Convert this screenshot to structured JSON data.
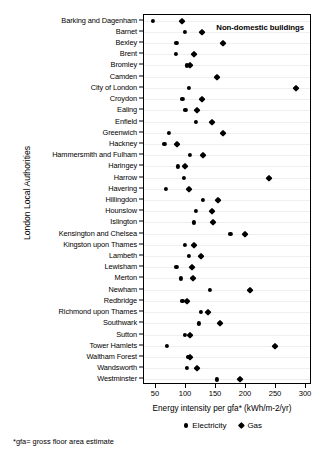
{
  "chart_data": {
    "type": "scatter",
    "title": "Non-domestic buildings",
    "xlabel": "Energy intensity per gfa* (kWh/m-2/yr)",
    "ylabel": "London Local Authorities",
    "xlim": [
      30,
      310
    ],
    "xticks": [
      50,
      100,
      150,
      200,
      250,
      300
    ],
    "xticklabels": [
      "50",
      "100",
      "150",
      "200",
      "250",
      "300"
    ],
    "grid": true,
    "legend_position": "bottom",
    "footnote": "*gfa= gross floor area estimate",
    "series": [
      {
        "name": "Electricity",
        "marker": "circle"
      },
      {
        "name": "Gas",
        "marker": "diamond"
      }
    ],
    "categories": [
      "Barking and Dagenham",
      "Barnet",
      "Bexley",
      "Brent",
      "Bromley",
      "Camden",
      "City of London",
      "Croydon",
      "Ealing",
      "Enfield",
      "Greenwich",
      "Hackney",
      "Hammersmith and Fulham",
      "Haringey",
      "Harrow",
      "Havering",
      "Hillingdon",
      "Hounslow",
      "Islington",
      "Kensington and Chelsea",
      "Kingston upon Thames",
      "Lambeth",
      "Lewisham",
      "Merton",
      "Newham",
      "Redbridge",
      "Richmond upon Thames",
      "Southwark",
      "Sutton",
      "Tower Hamlets",
      "Waltham Forest",
      "Wandsworth",
      "Westminster"
    ],
    "electricity": [
      45,
      98,
      84,
      83,
      101,
      151,
      105,
      94,
      99,
      117,
      71,
      64,
      107,
      87,
      96,
      67,
      128,
      117,
      113,
      174,
      98,
      105,
      84,
      92,
      140,
      94,
      125,
      121,
      98,
      68,
      103,
      102,
      152
    ],
    "gas": [
      94,
      127,
      161,
      113,
      106,
      151,
      283,
      127,
      119,
      144,
      161,
      85,
      128,
      98,
      239,
      105,
      154,
      143,
      145,
      199,
      113,
      125,
      110,
      111,
      206,
      101,
      136,
      156,
      107,
      248,
      107,
      119,
      190
    ]
  }
}
